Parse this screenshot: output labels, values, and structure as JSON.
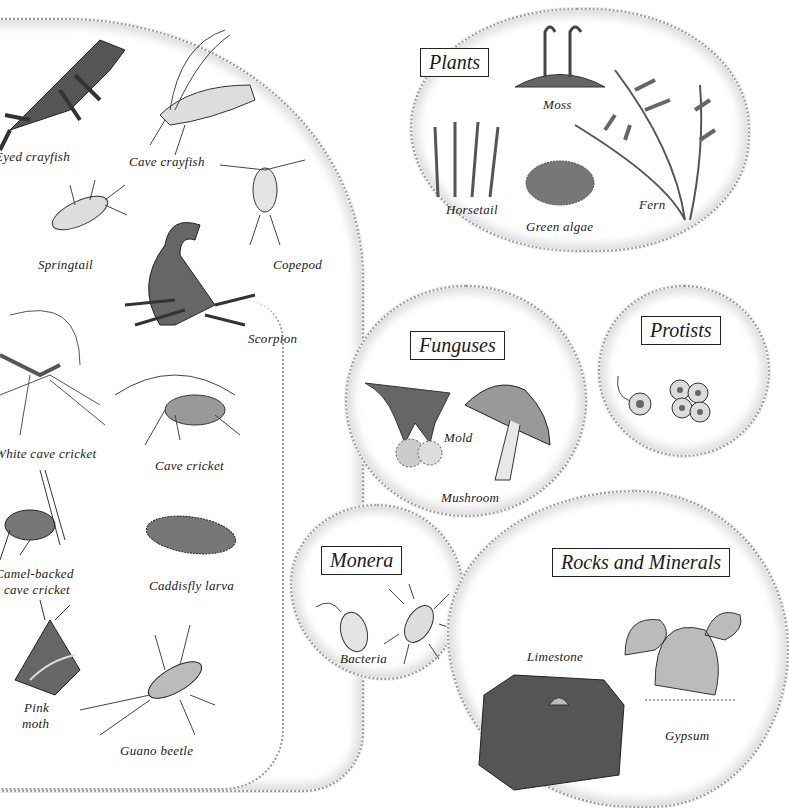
{
  "groups": {
    "animals": {
      "items": [
        {
          "label": "Eyed crayfish"
        },
        {
          "label": "Cave crayfish"
        },
        {
          "label": "Springtail"
        },
        {
          "label": "Copepod"
        },
        {
          "label": "Scorpion"
        },
        {
          "label": "White cave cricket"
        },
        {
          "label": "Cave cricket"
        },
        {
          "label": "Camel-backed"
        },
        {
          "label": "cave cricket"
        },
        {
          "label": "Caddisfly larva"
        },
        {
          "label": "Pink"
        },
        {
          "label": "moth"
        },
        {
          "label": "Guano beetle"
        }
      ]
    },
    "plants": {
      "title": "Plants",
      "items": [
        {
          "label": "Moss"
        },
        {
          "label": "Horsetail"
        },
        {
          "label": "Green algae"
        },
        {
          "label": "Fern"
        }
      ]
    },
    "funguses": {
      "title": "Funguses",
      "items": [
        {
          "label": "Mold"
        },
        {
          "label": "Mushroom"
        }
      ]
    },
    "protists": {
      "title": "Protists",
      "items": []
    },
    "monera": {
      "title": "Monera",
      "items": [
        {
          "label": "Bacteria"
        }
      ]
    },
    "rocks": {
      "title": "Rocks and Minerals",
      "items": [
        {
          "label": "Limestone"
        },
        {
          "label": "Gypsum"
        }
      ]
    }
  }
}
